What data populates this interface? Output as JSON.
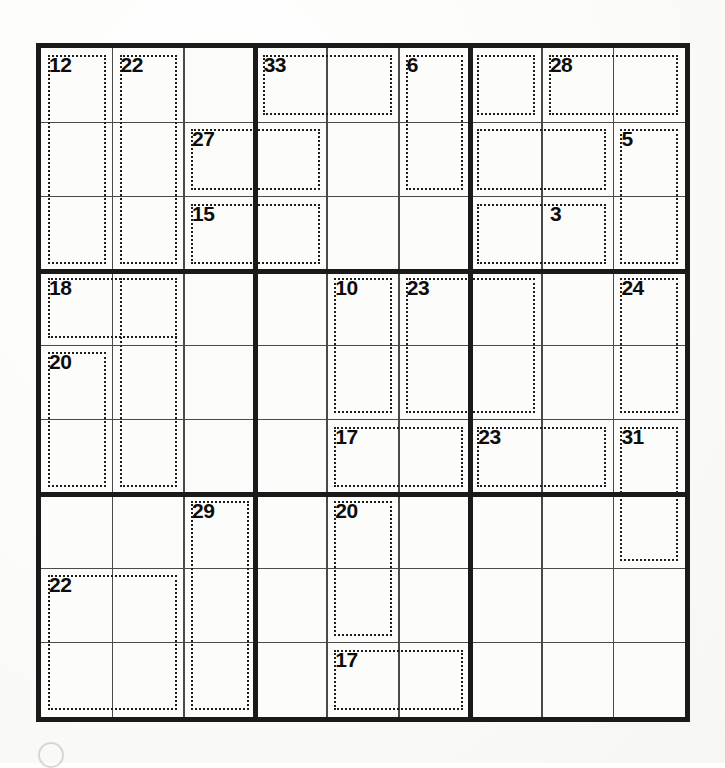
{
  "puzzle": {
    "type": "killer-sudoku",
    "grid_size": 9,
    "rows": 9,
    "cols": 9,
    "cell_values": [
      [
        "",
        "",
        "",
        "",
        "",
        "",
        "",
        "",
        ""
      ],
      [
        "",
        "",
        "",
        "",
        "",
        "",
        "",
        "",
        ""
      ],
      [
        "",
        "",
        "",
        "",
        "",
        "",
        "",
        "",
        ""
      ],
      [
        "",
        "",
        "",
        "",
        "",
        "",
        "",
        "",
        ""
      ],
      [
        "",
        "",
        "",
        "",
        "",
        "",
        "",
        "",
        ""
      ],
      [
        "",
        "",
        "",
        "",
        "",
        "",
        "",
        "",
        ""
      ],
      [
        "",
        "",
        "",
        "",
        "",
        "",
        "",
        "",
        ""
      ],
      [
        "",
        "",
        "",
        "",
        "",
        "",
        "",
        "",
        ""
      ],
      [
        "",
        "",
        "",
        "",
        "",
        "",
        "",
        "",
        ""
      ]
    ],
    "colors": {
      "grid_border": "#1a1a1a",
      "box_line": "#1a1a1a",
      "cell_line": "#4a4a4a",
      "cage_dash": "#1d1d1d",
      "sum_text": "#0d0d0d",
      "paper": "#fcfcfa"
    },
    "cages": [
      {
        "id": "cage-12",
        "sum": "12",
        "anchor": [
          0,
          0
        ],
        "cells": [
          [
            0,
            0
          ],
          [
            1,
            0
          ],
          [
            2,
            0
          ]
        ]
      },
      {
        "id": "cage-22a",
        "sum": "22",
        "anchor": [
          0,
          1
        ],
        "cells": [
          [
            0,
            1
          ],
          [
            1,
            1
          ],
          [
            2,
            1
          ]
        ]
      },
      {
        "id": "cage-27",
        "sum": "27",
        "anchor": [
          1,
          2
        ],
        "cells": [
          [
            0,
            2
          ],
          [
            0,
            3
          ],
          [
            1,
            2
          ]
        ]
      },
      {
        "id": "cage-33",
        "sum": "33",
        "anchor": [
          0,
          3
        ],
        "cells": [
          [
            0,
            3
          ]
        ]
      },
      {
        "id": "cage-15",
        "sum": "15",
        "anchor": [
          2,
          2
        ],
        "cells": [
          [
            2,
            2
          ],
          [
            2,
            3
          ]
        ]
      },
      {
        "id": "cage-6",
        "sum": "6",
        "anchor": [
          0,
          5
        ],
        "cells": [
          [
            0,
            5
          ],
          [
            1,
            5
          ]
        ]
      },
      {
        "id": "cage-28",
        "sum": "28",
        "anchor": [
          0,
          7
        ],
        "cells": [
          [
            0,
            7
          ],
          [
            0,
            8
          ]
        ]
      },
      {
        "id": "cage-5",
        "sum": "5",
        "anchor": [
          1,
          8
        ],
        "cells": [
          [
            1,
            8
          ],
          [
            2,
            8
          ]
        ]
      },
      {
        "id": "cage-3",
        "sum": "3",
        "anchor": [
          2,
          7
        ],
        "cells": [
          [
            2,
            7
          ]
        ]
      },
      {
        "id": "cage-18",
        "sum": "18",
        "anchor": [
          3,
          0
        ],
        "cells": [
          [
            3,
            0
          ],
          [
            3,
            1
          ]
        ]
      },
      {
        "id": "cage-20a",
        "sum": "20",
        "anchor": [
          4,
          0
        ],
        "cells": [
          [
            4,
            0
          ],
          [
            5,
            0
          ]
        ]
      },
      {
        "id": "cage-10",
        "sum": "10",
        "anchor": [
          3,
          4
        ],
        "cells": [
          [
            3,
            4
          ],
          [
            4,
            4
          ]
        ]
      },
      {
        "id": "cage-23a",
        "sum": "23",
        "anchor": [
          3,
          5
        ],
        "cells": [
          [
            3,
            5
          ],
          [
            4,
            5
          ]
        ]
      },
      {
        "id": "cage-24",
        "sum": "24",
        "anchor": [
          3,
          8
        ],
        "cells": [
          [
            3,
            8
          ],
          [
            4,
            8
          ]
        ]
      },
      {
        "id": "cage-17a",
        "sum": "17",
        "anchor": [
          5,
          4
        ],
        "cells": [
          [
            5,
            4
          ],
          [
            5,
            5
          ]
        ]
      },
      {
        "id": "cage-23b",
        "sum": "23",
        "anchor": [
          5,
          6
        ],
        "cells": [
          [
            5,
            6
          ],
          [
            5,
            7
          ]
        ]
      },
      {
        "id": "cage-31",
        "sum": "31",
        "anchor": [
          5,
          8
        ],
        "cells": [
          [
            5,
            8
          ],
          [
            6,
            8
          ]
        ]
      },
      {
        "id": "cage-29",
        "sum": "29",
        "anchor": [
          6,
          2
        ],
        "cells": [
          [
            6,
            2
          ],
          [
            7,
            2
          ],
          [
            8,
            2
          ]
        ]
      },
      {
        "id": "cage-20b",
        "sum": "20",
        "anchor": [
          6,
          4
        ],
        "cells": [
          [
            6,
            4
          ],
          [
            7,
            4
          ]
        ]
      },
      {
        "id": "cage-22b",
        "sum": "22",
        "anchor": [
          7,
          0
        ],
        "cells": [
          [
            7,
            0
          ],
          [
            8,
            0
          ],
          [
            7,
            1
          ],
          [
            8,
            1
          ]
        ]
      },
      {
        "id": "cage-17b",
        "sum": "17",
        "anchor": [
          8,
          4
        ],
        "cells": [
          [
            8,
            4
          ],
          [
            8,
            5
          ]
        ]
      }
    ],
    "cage_outline_rects": [
      {
        "name": "outline-12",
        "r": 0,
        "c": 0,
        "rs": 3,
        "cs": 1
      },
      {
        "name": "outline-22a",
        "r": 0,
        "c": 1,
        "rs": 3,
        "cs": 1
      },
      {
        "name": "outline-33",
        "r": 0,
        "c": 3,
        "rs": 1,
        "cs": 2
      },
      {
        "name": "outline-27",
        "r": 1,
        "c": 2,
        "rs": 1,
        "cs": 2
      },
      {
        "name": "outline-15",
        "r": 2,
        "c": 2,
        "rs": 1,
        "cs": 2
      },
      {
        "name": "outline-6",
        "r": 0,
        "c": 5,
        "rs": 2,
        "cs": 1
      },
      {
        "name": "outline-r1c7",
        "r": 0,
        "c": 6,
        "rs": 1,
        "cs": 1
      },
      {
        "name": "outline-28",
        "r": 0,
        "c": 7,
        "rs": 1,
        "cs": 2
      },
      {
        "name": "outline-r2c7",
        "r": 1,
        "c": 6,
        "rs": 1,
        "cs": 2
      },
      {
        "name": "outline-5",
        "r": 1,
        "c": 8,
        "rs": 2,
        "cs": 1
      },
      {
        "name": "outline-3",
        "r": 2,
        "c": 6,
        "rs": 1,
        "cs": 2
      },
      {
        "name": "outline-18",
        "r": 3,
        "c": 0,
        "rs": 1,
        "cs": 2
      },
      {
        "name": "outline-20a",
        "r": 4,
        "c": 0,
        "rs": 2,
        "cs": 1
      },
      {
        "name": "outline-c2mid",
        "r": 3,
        "c": 1,
        "rs": 3,
        "cs": 1
      },
      {
        "name": "outline-10",
        "r": 3,
        "c": 4,
        "rs": 2,
        "cs": 1
      },
      {
        "name": "outline-23a",
        "r": 3,
        "c": 5,
        "rs": 2,
        "cs": 2
      },
      {
        "name": "outline-24",
        "r": 3,
        "c": 8,
        "rs": 2,
        "cs": 1
      },
      {
        "name": "outline-17a",
        "r": 5,
        "c": 4,
        "rs": 1,
        "cs": 2
      },
      {
        "name": "outline-23b",
        "r": 5,
        "c": 6,
        "rs": 1,
        "cs": 2
      },
      {
        "name": "outline-31",
        "r": 5,
        "c": 8,
        "rs": 2,
        "cs": 1
      },
      {
        "name": "outline-29",
        "r": 6,
        "c": 2,
        "rs": 3,
        "cs": 1
      },
      {
        "name": "outline-20b",
        "r": 6,
        "c": 4,
        "rs": 2,
        "cs": 1
      },
      {
        "name": "outline-22b",
        "r": 7,
        "c": 0,
        "rs": 2,
        "cs": 2
      },
      {
        "name": "outline-17b",
        "r": 8,
        "c": 4,
        "rs": 1,
        "cs": 2
      }
    ]
  }
}
